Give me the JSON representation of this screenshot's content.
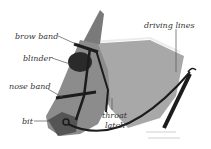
{
  "diagram": {
    "labels": [
      {
        "id": "brow-band",
        "text": "brow band"
      },
      {
        "id": "blinder",
        "text": "blinder"
      },
      {
        "id": "nose-band",
        "text": "nose band"
      },
      {
        "id": "bit",
        "text": "bit"
      },
      {
        "id": "throat-latch-1",
        "text": "throat"
      },
      {
        "id": "throat-latch-2",
        "text": "latch"
      },
      {
        "id": "driving-lines",
        "text": "driving lines"
      }
    ],
    "colors": {
      "background": "#ffffff",
      "label_text": "#333333",
      "leader_line": "#555555",
      "coat": "#a8a8a8",
      "coat_dark": "#6e6e6e",
      "tack": "#1c1c1c"
    }
  }
}
